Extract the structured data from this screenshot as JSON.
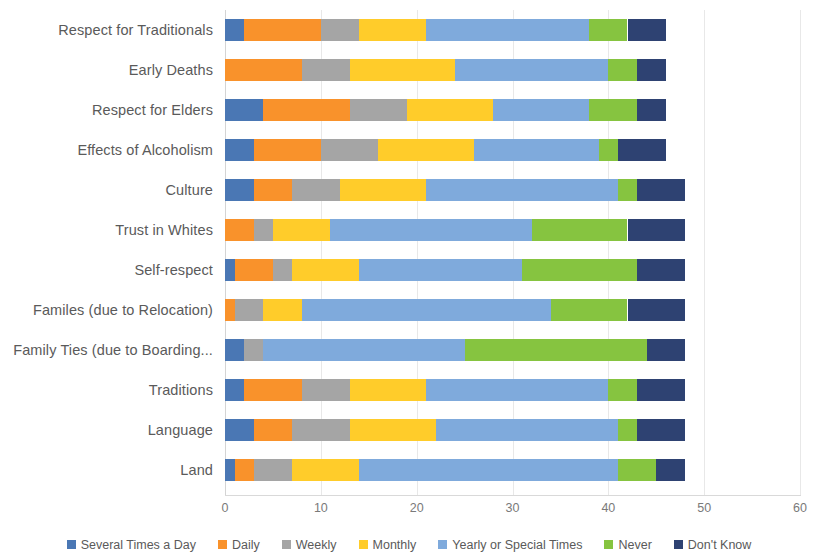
{
  "chart_data": {
    "type": "bar",
    "orientation": "horizontal",
    "stacked": true,
    "title": "",
    "xlabel": "",
    "ylabel": "",
    "xlim": [
      0,
      60
    ],
    "xticks": [
      "0",
      "10",
      "20",
      "30",
      "40",
      "50",
      "60"
    ],
    "grid": true,
    "legend_position": "bottom",
    "categories": [
      "Respect for Traditionals",
      "Early Deaths",
      "Respect for Elders",
      "Effects of Alcoholism",
      "Culture",
      "Trust in Whites",
      "Self-respect",
      "Familes (due to Relocation)",
      "Family Ties (due to Boarding...",
      "Traditions",
      "Language",
      "Land"
    ],
    "series": [
      {
        "name": "Several Times a Day",
        "color": "#4A77B4",
        "values": [
          2,
          0,
          4,
          3,
          3,
          0,
          1,
          0,
          2,
          2,
          3,
          1
        ]
      },
      {
        "name": "Daily",
        "color": "#F9922B",
        "values": [
          8,
          8,
          9,
          7,
          4,
          3,
          4,
          1,
          0,
          6,
          4,
          2
        ]
      },
      {
        "name": "Weekly",
        "color": "#A5A5A5",
        "values": [
          4,
          5,
          6,
          6,
          5,
          2,
          2,
          3,
          2,
          5,
          6,
          4
        ]
      },
      {
        "name": "Monthly",
        "color": "#FFCC2A",
        "values": [
          7,
          11,
          9,
          10,
          9,
          6,
          7,
          4,
          0,
          8,
          9,
          7
        ]
      },
      {
        "name": "Yearly or Special Times",
        "color": "#7FAADC",
        "values": [
          17,
          16,
          10,
          13,
          20,
          21,
          17,
          26,
          21,
          19,
          19,
          27
        ]
      },
      {
        "name": "Never",
        "color": "#86C440",
        "values": [
          4,
          3,
          5,
          2,
          2,
          10,
          12,
          8,
          19,
          3,
          2,
          4
        ]
      },
      {
        "name": "Don't Know",
        "color": "#2E4272",
        "values": [
          4,
          3,
          3,
          5,
          5,
          6,
          5,
          6,
          4,
          5,
          5,
          3
        ]
      }
    ]
  }
}
